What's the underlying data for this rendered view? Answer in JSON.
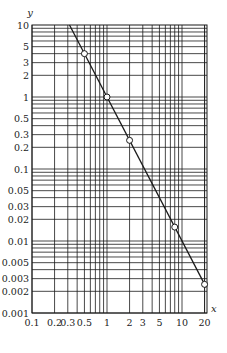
{
  "chart_data": {
    "type": "line",
    "title": "",
    "xlabel": "x",
    "ylabel": "y",
    "xscale": "log",
    "yscale": "log",
    "xlim": [
      0.1,
      20
    ],
    "ylim": [
      0.001,
      10
    ],
    "grid": true,
    "x_tick_labels": [
      "0.1",
      "0.2",
      "0.3",
      "0.5",
      "1",
      "2",
      "3",
      "5",
      "10",
      "20"
    ],
    "x_ticks": [
      0.1,
      0.2,
      0.3,
      0.5,
      1,
      2,
      3,
      5,
      10,
      20
    ],
    "y_tick_labels": [
      "10",
      "5",
      "3",
      "2",
      "1",
      "0.5",
      "0.3",
      "0.2",
      "0.1",
      "0.05",
      "0.03",
      "0.02",
      "0.01",
      "0.005",
      "0.003",
      "0.002",
      "0.001"
    ],
    "y_ticks": [
      10,
      5,
      3,
      2,
      1,
      0.5,
      0.3,
      0.2,
      0.1,
      0.05,
      0.03,
      0.02,
      0.01,
      0.005,
      0.003,
      0.002,
      0.001
    ],
    "series": [
      {
        "name": "fit line y = x^-2",
        "style": "line",
        "x": [
          0.316,
          21
        ],
        "y": [
          10,
          0.00227
        ]
      },
      {
        "name": "data points",
        "style": "open-circle-markers",
        "x": [
          0.5,
          1,
          2,
          8,
          20
        ],
        "y": [
          4,
          1,
          0.25,
          0.0156,
          0.0025
        ]
      }
    ],
    "legend": null
  }
}
